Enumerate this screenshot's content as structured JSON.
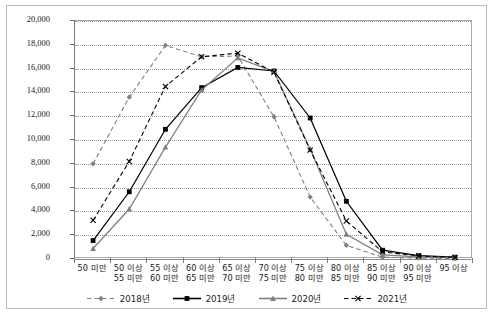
{
  "chart_data": {
    "type": "line",
    "title": "",
    "xlabel": "",
    "ylabel": "",
    "ylim": [
      0,
      20000
    ],
    "ytick_step": 2000,
    "grid": true,
    "legend_position": "bottom",
    "categories": [
      "50 미만",
      "50 이상\n55 미만",
      "55 이상\n60 미만",
      "60 이상\n65 미만",
      "65 이상\n70 미만",
      "70 이상\n75 미만",
      "75 이상\n80 미만",
      "80 이상\n85 미만",
      "85 이상\n90 미만",
      "90 이상\n95 미만",
      "95 이상"
    ],
    "ytick_labels": [
      "0",
      "2,000",
      "4,000",
      "6,000",
      "8,000",
      "10,000",
      "12,000",
      "14,000",
      "16,000",
      "18,000",
      "20,000"
    ],
    "ytick_values": [
      0,
      2000,
      4000,
      6000,
      8000,
      10000,
      12000,
      14000,
      16000,
      18000,
      20000
    ],
    "series": [
      {
        "name": "2018년",
        "color": "#808080",
        "style": "dashed",
        "marker": "diamond",
        "values": [
          8000,
          13600,
          17950,
          17000,
          17050,
          11950,
          5200,
          1150,
          150,
          80,
          40
        ]
      },
      {
        "name": "2019년",
        "color": "#000000",
        "style": "solid",
        "marker": "square",
        "values": [
          1550,
          5650,
          10900,
          14400,
          16100,
          15800,
          11850,
          4850,
          740,
          280,
          150
        ]
      },
      {
        "name": "2020년",
        "color": "#7f7f7f",
        "style": "solid",
        "marker": "triangle",
        "values": [
          880,
          4200,
          9400,
          14200,
          16900,
          15750,
          9250,
          2080,
          350,
          180,
          110
        ]
      },
      {
        "name": "2021년",
        "color": "#000000",
        "style": "dashed",
        "marker": "x",
        "values": [
          3250,
          8200,
          14500,
          17000,
          17300,
          15700,
          9150,
          3200,
          600,
          250,
          130
        ]
      }
    ]
  },
  "legend": {
    "items": [
      {
        "label": "2018년"
      },
      {
        "label": "2019년"
      },
      {
        "label": "2020년"
      },
      {
        "label": "2021년"
      }
    ]
  }
}
